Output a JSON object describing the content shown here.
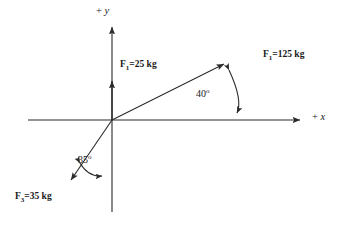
{
  "diagram": {
    "type": "force-vector-diagram",
    "background_color": "#ffffff",
    "line_color": "#2b2b2b",
    "text_color": "#1a1a1a",
    "origin": {
      "x": 112,
      "y": 120
    },
    "axes": {
      "x": {
        "label_plus": "+",
        "label_name": "x",
        "label_full": "+ x",
        "start_x": 28,
        "end_x": 305,
        "y": 120
      },
      "y": {
        "label_plus": "+",
        "label_name": "y",
        "label_full": "+ y",
        "top_y": 22,
        "bottom_y": 212,
        "x": 112
      }
    },
    "forces": [
      {
        "id": "f-vertical",
        "symbol": "F",
        "subscript": "1",
        "magnitude": "25",
        "unit": "kg",
        "label": "F1=25 kg",
        "direction": "up along +y axis",
        "angle_from_x_axis_deg": 90,
        "tip": {
          "x": 112,
          "y": 76
        }
      },
      {
        "id": "f-diagonal",
        "symbol": "F",
        "subscript": "1",
        "magnitude": "125",
        "unit": "kg",
        "label": "F1=125 kg",
        "direction": "up and to the right, first quadrant",
        "angle_from_x_axis_deg": 40,
        "tip": {
          "x": 228,
          "y": 60
        }
      },
      {
        "id": "f-lower-left",
        "symbol": "F",
        "subscript": "3",
        "magnitude": "35",
        "unit": "kg",
        "label": "F3=35 kg",
        "direction": "down and to the left, third quadrant",
        "angle_from_negative_y_axis_deg": 35,
        "tip": {
          "x": 67,
          "y": 185
        }
      }
    ],
    "angles": [
      {
        "id": "angle-40",
        "value": "40",
        "degree_mark": "o",
        "label": "40o",
        "between": "positive x-axis and 125 kg force vector",
        "label_position": {
          "x": 197,
          "y": 89
        }
      },
      {
        "id": "angle-35",
        "value": "35",
        "degree_mark": "o",
        "label": "35o",
        "between": "negative y-axis and 35 kg force vector",
        "label_position": {
          "x": 79,
          "y": 155
        }
      }
    ]
  }
}
